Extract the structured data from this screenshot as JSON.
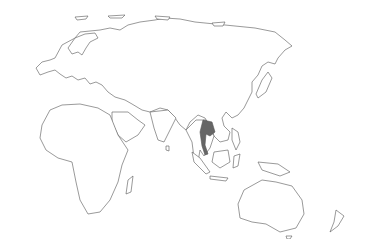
{
  "map": {
    "projection": "Eastern hemisphere outline",
    "highlighted_country": "Thailand",
    "colors": {
      "background": "#ffffff",
      "outline": "#555555",
      "highlight": "#666666"
    }
  }
}
